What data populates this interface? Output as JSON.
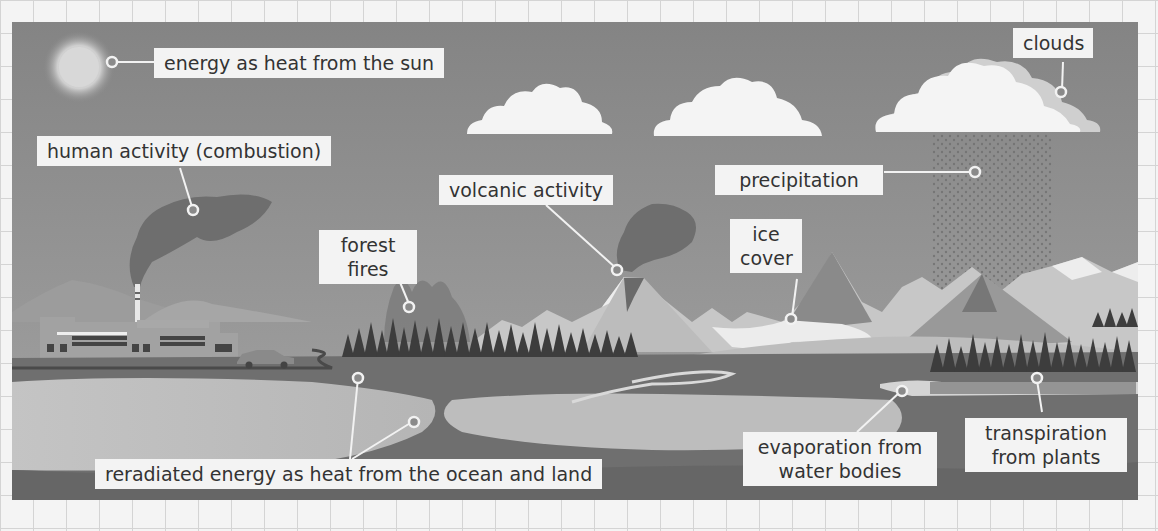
{
  "diagram": {
    "type": "greenhouse-gas-sources-illustration",
    "colors": {
      "sky": "#8a8a8a",
      "label_bg": "#f3f3f3",
      "label_text": "#333333",
      "leader_line": "#f0f0f0",
      "cloud": "#f5f5f5",
      "ground": "#6f6f6f",
      "water": "#c8c8c8"
    },
    "labels": {
      "sun": "energy as heat from the sun",
      "human": "human activity (combustion)",
      "volcanic": "volcanic activity",
      "forest_line1": "forest",
      "forest_line2": "fires",
      "ice_line1": "ice",
      "ice_line2": "cover",
      "precipitation": "precipitation",
      "clouds": "clouds",
      "reradiated": "reradiated energy as heat from the ocean and land",
      "evaporation_line1": "evaporation from",
      "evaporation_line2": "water bodies",
      "transpiration_line1": "transpiration",
      "transpiration_line2": "from plants"
    }
  }
}
